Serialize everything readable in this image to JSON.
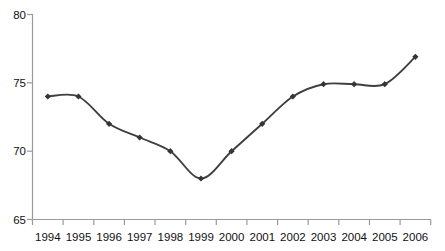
{
  "chart_data": {
    "type": "line",
    "title": "",
    "subtitle": "",
    "xlabel": "",
    "ylabel": "",
    "categories": [
      "1994",
      "1995",
      "1996",
      "1997",
      "1998",
      "1999",
      "2000",
      "2001",
      "2002",
      "2003",
      "2004",
      "2005",
      "2006"
    ],
    "values": [
      74.0,
      74.0,
      72.0,
      71.0,
      70.0,
      68.0,
      70.0,
      72.0,
      74.0,
      74.9,
      74.9,
      74.9,
      76.9
    ],
    "series": [
      {
        "name": "",
        "values": [
          74.0,
          74.0,
          72.0,
          71.0,
          70.0,
          68.0,
          70.0,
          72.0,
          74.0,
          74.9,
          74.9,
          74.9,
          76.9
        ]
      }
    ],
    "ylim": [
      65,
      80
    ],
    "ytick_labels": [
      "65",
      "70",
      "75",
      "80"
    ],
    "ytick_values": [
      65,
      70,
      75,
      80
    ],
    "xtick_labels": [
      "1994",
      "1995",
      "1996",
      "1997",
      "1998",
      "1999",
      "2000",
      "2001",
      "2002",
      "2003",
      "2004",
      "2005",
      "2006"
    ],
    "grid": false,
    "legend": false,
    "legend_position": "none",
    "marker": "diamond",
    "line_color": "#3f3f3f",
    "marker_color": "#353535",
    "axis_color": "#9a9a9a",
    "background_color": "#ffffff",
    "annotations": []
  },
  "axis": {
    "y_labels": [
      "80",
      "75",
      "70",
      "65"
    ],
    "x_labels": [
      "1994",
      "1995",
      "1996",
      "1997",
      "1998",
      "1999",
      "2000",
      "2001",
      "2002",
      "2003",
      "2004",
      "2005",
      "2006"
    ]
  }
}
